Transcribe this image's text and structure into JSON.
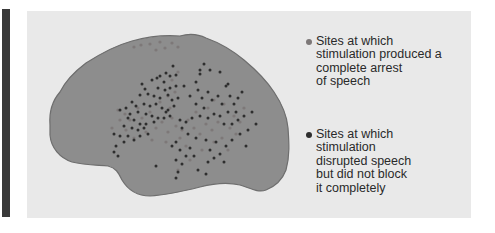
{
  "colors": {
    "panel_bg": "#e9e9e9",
    "side_bar": "#3a3a3a",
    "brain_fill": "#8d8d8d",
    "brain_outline": "#6e6e6e",
    "arrest_dot": "#7d7878",
    "disrupt_dot": "#2e2e2e"
  },
  "legend": {
    "arrest": {
      "icon": "light-gray-dot",
      "label": "Sites at which\nstimulation produced a\ncomplete arrest\nof speech"
    },
    "disrupt": {
      "icon": "dark-gray-dot",
      "label": "Sites at which\nstimulation\ndisrupted speech\nbut did not block\nit completely"
    }
  },
  "brain_outline_path": "M50,125 C49,112 53,100 60,92 C66,80 74,72 86,63 C100,54 114,46 132,41 C150,36 168,35 180,36 C190,33 198,34 206,38 C220,43 232,50 244,60 C256,70 266,80 274,92 C282,104 287,115 288,128 C289,142 290,156 286,170 C283,178 276,186 266,190 C258,193 250,188 240,185 C228,182 215,183 200,187 C184,191 168,195 150,196 C138,196 128,190 122,180 C118,172 116,168 108,166 C96,165 84,165 72,162 C60,158 51,148 50,135 Z",
  "arrest_dots": [
    [
      134,
      47
    ],
    [
      141,
      45
    ],
    [
      150,
      44
    ],
    [
      160,
      42
    ],
    [
      165,
      48
    ],
    [
      172,
      43
    ],
    [
      178,
      47
    ],
    [
      156,
      50
    ],
    [
      118,
      110
    ],
    [
      125,
      114
    ],
    [
      130,
      120
    ],
    [
      138,
      108
    ],
    [
      142,
      118
    ],
    [
      150,
      112
    ],
    [
      156,
      128
    ],
    [
      162,
      122
    ],
    [
      168,
      132
    ],
    [
      172,
      118
    ],
    [
      176,
      126
    ],
    [
      182,
      130
    ],
    [
      188,
      120
    ],
    [
      194,
      128
    ],
    [
      200,
      134
    ],
    [
      206,
      124
    ],
    [
      212,
      130
    ],
    [
      218,
      122
    ],
    [
      222,
      138
    ],
    [
      230,
      128
    ],
    [
      236,
      134
    ],
    [
      126,
      130
    ],
    [
      134,
      138
    ],
    [
      146,
      132
    ],
    [
      152,
      140
    ],
    [
      160,
      102
    ],
    [
      168,
      96
    ],
    [
      175,
      92
    ],
    [
      172,
      80
    ],
    [
      178,
      72
    ],
    [
      170,
      108
    ],
    [
      196,
      112
    ],
    [
      208,
      108
    ],
    [
      214,
      100
    ],
    [
      224,
      104
    ],
    [
      234,
      116
    ],
    [
      240,
      122
    ],
    [
      244,
      108
    ],
    [
      186,
      146
    ],
    [
      202,
      150
    ],
    [
      214,
      142
    ],
    [
      228,
      150
    ],
    [
      190,
      160
    ],
    [
      178,
      170
    ],
    [
      120,
      120
    ],
    [
      112,
      128
    ],
    [
      180,
      138
    ],
    [
      166,
      142
    ]
  ],
  "disrupt_dots": [
    [
      173,
      66
    ],
    [
      166,
      73
    ],
    [
      160,
      76
    ],
    [
      170,
      76
    ],
    [
      176,
      75
    ],
    [
      142,
      84
    ],
    [
      145,
      89
    ],
    [
      152,
      80
    ],
    [
      157,
      78
    ],
    [
      164,
      82
    ],
    [
      158,
      88
    ],
    [
      165,
      90
    ],
    [
      170,
      88
    ],
    [
      176,
      86
    ],
    [
      140,
      95
    ],
    [
      148,
      94
    ],
    [
      154,
      96
    ],
    [
      160,
      98
    ],
    [
      168,
      95
    ],
    [
      172,
      100
    ],
    [
      178,
      98
    ],
    [
      132,
      102
    ],
    [
      136,
      106
    ],
    [
      144,
      104
    ],
    [
      150,
      106
    ],
    [
      156,
      104
    ],
    [
      162,
      108
    ],
    [
      166,
      112
    ],
    [
      174,
      106
    ],
    [
      120,
      110
    ],
    [
      126,
      108
    ],
    [
      130,
      114
    ],
    [
      138,
      112
    ],
    [
      146,
      114
    ],
    [
      152,
      116
    ],
    [
      158,
      118
    ],
    [
      164,
      118
    ],
    [
      170,
      116
    ],
    [
      128,
      118
    ],
    [
      134,
      120
    ],
    [
      140,
      124
    ],
    [
      146,
      124
    ],
    [
      154,
      122
    ],
    [
      124,
      126
    ],
    [
      132,
      128
    ],
    [
      138,
      130
    ],
    [
      144,
      128
    ],
    [
      114,
      134
    ],
    [
      120,
      136
    ],
    [
      128,
      136
    ],
    [
      134,
      140
    ],
    [
      116,
      146
    ],
    [
      124,
      142
    ],
    [
      140,
      136
    ],
    [
      148,
      134
    ],
    [
      114,
      152
    ],
    [
      118,
      156
    ],
    [
      168,
      110
    ],
    [
      184,
      86
    ],
    [
      190,
      96
    ],
    [
      196,
      82
    ],
    [
      200,
      74
    ],
    [
      198,
      90
    ],
    [
      202,
      98
    ],
    [
      196,
      104
    ],
    [
      204,
      108
    ],
    [
      208,
      92
    ],
    [
      212,
      100
    ],
    [
      218,
      96
    ],
    [
      222,
      104
    ],
    [
      226,
      86
    ],
    [
      230,
      96
    ],
    [
      234,
      104
    ],
    [
      228,
      112
    ],
    [
      220,
      116
    ],
    [
      214,
      114
    ],
    [
      208,
      118
    ],
    [
      200,
      116
    ],
    [
      192,
      118
    ],
    [
      186,
      122
    ],
    [
      180,
      120
    ],
    [
      224,
      124
    ],
    [
      232,
      124
    ],
    [
      238,
      120
    ],
    [
      244,
      116
    ],
    [
      236,
      112
    ],
    [
      248,
      130
    ],
    [
      240,
      134
    ],
    [
      232,
      140
    ],
    [
      226,
      146
    ],
    [
      216,
      142
    ],
    [
      206,
      140
    ],
    [
      196,
      138
    ],
    [
      188,
      134
    ],
    [
      182,
      128
    ],
    [
      176,
      142
    ],
    [
      172,
      146
    ],
    [
      180,
      150
    ],
    [
      186,
      156
    ],
    [
      176,
      160
    ],
    [
      182,
      164
    ],
    [
      178,
      172
    ],
    [
      176,
      178
    ],
    [
      190,
      148
    ],
    [
      194,
      156
    ],
    [
      210,
      150
    ],
    [
      214,
      158
    ],
    [
      220,
      154
    ],
    [
      224,
      162
    ],
    [
      208,
      162
    ],
    [
      252,
      112
    ],
    [
      256,
      124
    ],
    [
      246,
      146
    ],
    [
      204,
      64
    ],
    [
      200,
      70
    ],
    [
      210,
      70
    ],
    [
      220,
      72
    ],
    [
      228,
      84
    ],
    [
      238,
      98
    ],
    [
      242,
      92
    ],
    [
      156,
      166
    ],
    [
      198,
      170
    ],
    [
      206,
      174
    ]
  ]
}
